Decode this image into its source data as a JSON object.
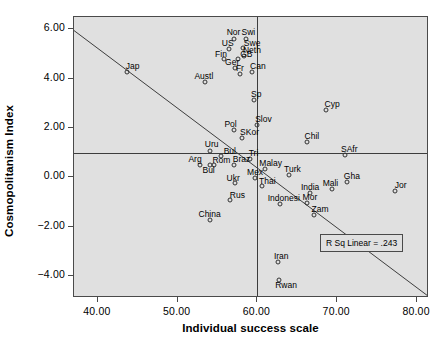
{
  "chart_data": {
    "type": "scatter",
    "title": "",
    "xlabel": "Individual success scale",
    "ylabel": "Cosmopolitanism Index",
    "xlim": [
      37.0,
      81.5
    ],
    "ylim": [
      -4.9,
      6.5
    ],
    "xticks": [
      "40.00",
      "50.00",
      "60.00",
      "70.00",
      "80.00"
    ],
    "xtickvalues": [
      40,
      50,
      60,
      70,
      80
    ],
    "yticks": [
      "6.00",
      "4.00",
      "2.00",
      "0.00",
      "-2.00",
      "-4.00"
    ],
    "ytickvalues": [
      6,
      4,
      2,
      0,
      -2,
      -4
    ],
    "grid": false,
    "legend": false,
    "annotation": "R Sq Linear = .243",
    "reference_lines": [
      {
        "orientation": "vertical",
        "value": 60.0
      },
      {
        "orientation": "horizontal",
        "value": 1.0
      }
    ],
    "fit_line": {
      "type": "linear",
      "x0": 37.0,
      "y0": 5.95,
      "x1": 81.5,
      "y1": -4.85
    },
    "points": [
      {
        "label": "Jap",
        "x": 43.6,
        "y": 4.25,
        "lx": 6,
        "ly": -11
      },
      {
        "label": "Nor",
        "x": 57.0,
        "y": 5.62,
        "lx": 0,
        "ly": -12
      },
      {
        "label": "Swi",
        "x": 58.6,
        "y": 5.62,
        "lx": 2,
        "ly": -12
      },
      {
        "label": "US",
        "x": 56.4,
        "y": 5.2,
        "lx": -1,
        "ly": -11
      },
      {
        "label": "Swe",
        "x": 58.2,
        "y": 5.25,
        "lx": 9,
        "ly": -10
      },
      {
        "label": "Neth",
        "x": 58.3,
        "y": 4.92,
        "lx": 8,
        "ly": -11
      },
      {
        "label": "Fin",
        "x": 55.8,
        "y": 4.78,
        "lx": -3,
        "ly": -10
      },
      {
        "label": "GB",
        "x": 57.6,
        "y": 4.8,
        "lx": 8,
        "ly": -10
      },
      {
        "label": "Ger",
        "x": 57.2,
        "y": 4.42,
        "lx": -3,
        "ly": -11
      },
      {
        "label": "Fr",
        "x": 57.8,
        "y": 4.2,
        "lx": 0,
        "ly": -11
      },
      {
        "label": "Can",
        "x": 59.3,
        "y": 4.28,
        "lx": 6,
        "ly": -11
      },
      {
        "label": "Austl",
        "x": 53.4,
        "y": 3.85,
        "lx": -1,
        "ly": -11
      },
      {
        "label": "Sp",
        "x": 59.6,
        "y": 3.12,
        "lx": 2,
        "ly": -11
      },
      {
        "label": "Cyp",
        "x": 68.6,
        "y": 2.72,
        "lx": 6,
        "ly": -11
      },
      {
        "label": "Slov",
        "x": 60.0,
        "y": 2.1,
        "lx": 6,
        "ly": -11
      },
      {
        "label": "Pol",
        "x": 57.0,
        "y": 1.92,
        "lx": -3,
        "ly": -11
      },
      {
        "label": "SKor",
        "x": 58.0,
        "y": 1.6,
        "lx": 8,
        "ly": -11
      },
      {
        "label": "Chil",
        "x": 66.2,
        "y": 1.42,
        "lx": 5,
        "ly": -11
      },
      {
        "label": "Uru",
        "x": 54.0,
        "y": 1.05,
        "lx": 2,
        "ly": -12
      },
      {
        "label": "Bul",
        "x": 55.4,
        "y": 0.86,
        "lx": 9,
        "ly": -10
      },
      {
        "label": "Tri",
        "x": 59.0,
        "y": 0.72,
        "lx": 4,
        "ly": -11
      },
      {
        "label": "SAfr",
        "x": 71.0,
        "y": 0.9,
        "lx": 4,
        "ly": -11
      },
      {
        "label": "Arg",
        "x": 52.8,
        "y": 0.48,
        "lx": -5,
        "ly": -11
      },
      {
        "label": "Rom",
        "x": 54.6,
        "y": 0.48,
        "lx": 7,
        "ly": -10
      },
      {
        "label": "Braz",
        "x": 57.0,
        "y": 0.48,
        "lx": 8,
        "ly": -11
      },
      {
        "label": "Bul",
        "x": 54.0,
        "y": 0.48,
        "lx": -1,
        "ly": 0
      },
      {
        "label": "Malay",
        "x": 60.9,
        "y": 0.32,
        "lx": 6,
        "ly": -11
      },
      {
        "label": "Turk",
        "x": 64.0,
        "y": 0.1,
        "lx": 3,
        "ly": -11
      },
      {
        "label": "Gha",
        "x": 71.2,
        "y": -0.18,
        "lx": 5,
        "ly": -11
      },
      {
        "label": "Jor",
        "x": 77.2,
        "y": -0.55,
        "lx": 6,
        "ly": -11
      },
      {
        "label": "Ukr",
        "x": 57.2,
        "y": -0.22,
        "lx": -2,
        "ly": -10
      },
      {
        "label": "Mex",
        "x": 59.7,
        "y": -0.02,
        "lx": 0,
        "ly": -11
      },
      {
        "label": "Thai",
        "x": 60.6,
        "y": -0.35,
        "lx": 5,
        "ly": -10
      },
      {
        "label": "India",
        "x": 66.6,
        "y": -0.62,
        "lx": 0,
        "ly": -11
      },
      {
        "label": "Mali",
        "x": 69.4,
        "y": -0.48,
        "lx": -2,
        "ly": -11
      },
      {
        "label": "Rus",
        "x": 56.6,
        "y": -0.92,
        "lx": 7,
        "ly": -10
      },
      {
        "label": "Indonesi",
        "x": 62.8,
        "y": -1.08,
        "lx": 4,
        "ly": -11
      },
      {
        "label": "Mor",
        "x": 66.2,
        "y": -1.05,
        "lx": 3,
        "ly": -11
      },
      {
        "label": "Zam",
        "x": 67.1,
        "y": -1.52,
        "lx": 6,
        "ly": -11
      },
      {
        "label": "China",
        "x": 54.0,
        "y": -1.72,
        "lx": 0,
        "ly": -11
      },
      {
        "label": "Iran",
        "x": 62.6,
        "y": -3.42,
        "lx": 3,
        "ly": -11
      },
      {
        "label": "Rwan",
        "x": 62.7,
        "y": -4.15,
        "lx": 7,
        "ly": 0
      }
    ]
  }
}
